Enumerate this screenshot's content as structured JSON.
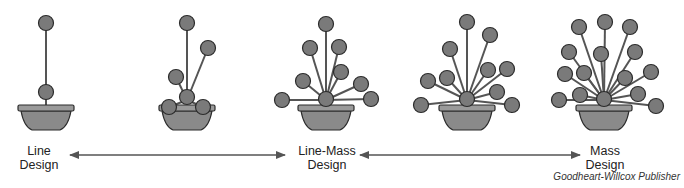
{
  "figure": {
    "type": "diagram",
    "colors": {
      "flower_fill": "#7a7a7a",
      "flower_stroke": "#2b2b2b",
      "stem": "#555555",
      "bowl_fill": "#8a8a8a",
      "rim_fill": "#9a9a9a",
      "arrow": "#555555"
    },
    "arrangements": [
      {
        "id": "line",
        "cx": 46,
        "flowers": [
          [
            46,
            23
          ],
          [
            46,
            92
          ]
        ]
      },
      {
        "id": "line-mid",
        "cx": 187,
        "flowers": [
          [
            187,
            23
          ],
          [
            208,
            48
          ],
          [
            176,
            77
          ],
          [
            169,
            107
          ],
          [
            203,
            107
          ],
          [
            187,
            97
          ]
        ]
      },
      {
        "id": "line-mass",
        "cx": 326,
        "flowers": [
          [
            326,
            24
          ],
          [
            310,
            48
          ],
          [
            339,
            47
          ],
          [
            341,
            72
          ],
          [
            303,
            81
          ],
          [
            361,
            84
          ],
          [
            282,
            100
          ],
          [
            371,
            99
          ],
          [
            326,
            99
          ]
        ]
      },
      {
        "id": "mass-mid",
        "cx": 467,
        "flowers": [
          [
            467,
            22
          ],
          [
            490,
            35
          ],
          [
            450,
            49
          ],
          [
            488,
            70
          ],
          [
            507,
            69
          ],
          [
            428,
            81
          ],
          [
            447,
            78
          ],
          [
            497,
            92
          ],
          [
            421,
            105
          ],
          [
            512,
            105
          ],
          [
            467,
            99
          ]
        ]
      },
      {
        "id": "mass",
        "cx": 604,
        "flowers": [
          [
            605,
            22
          ],
          [
            579,
            27
          ],
          [
            630,
            27
          ],
          [
            569,
            52
          ],
          [
            601,
            54
          ],
          [
            635,
            52
          ],
          [
            565,
            74
          ],
          [
            584,
            73
          ],
          [
            625,
            78
          ],
          [
            651,
            72
          ],
          [
            580,
            95
          ],
          [
            638,
            94
          ],
          [
            559,
            100
          ],
          [
            656,
            106
          ],
          [
            604,
            99
          ]
        ]
      }
    ],
    "labels": [
      {
        "line1": "Line",
        "line2": "Design",
        "x": 18,
        "y": 145
      },
      {
        "line1": "Line-Mass",
        "line2": "Design",
        "x": 296,
        "y": 145
      },
      {
        "line1": "Mass",
        "line2": "Design",
        "x": 585,
        "y": 145
      }
    ],
    "arrows": [
      {
        "from": "Line Design",
        "to": "Line-Mass Design",
        "x1": 70,
        "x2": 285,
        "y": 155,
        "bidirectional": true
      },
      {
        "from": "Line-Mass Design",
        "to": "Mass Design",
        "x1": 360,
        "x2": 580,
        "y": 155,
        "bidirectional": true
      }
    ],
    "credit": "Goodheart-Willcox Publisher"
  }
}
